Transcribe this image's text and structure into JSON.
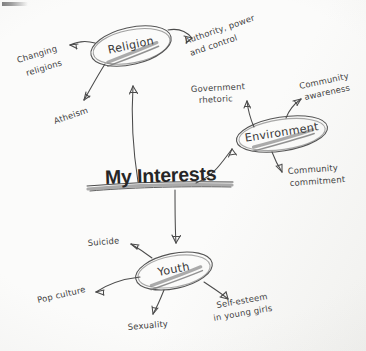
{
  "document": {
    "kind": "hand-drawn mind map",
    "medium": "scanned paper, pencil/pen",
    "title": "My Interests"
  },
  "center": {
    "label": "My Interests",
    "style": "printed bold sans-serif with hand-drawn underline"
  },
  "palette": {
    "paper": "#fbfbfa",
    "ink": "#4b4b4b",
    "ink_light": "#5a5a5a",
    "shading": "#8a8a8a",
    "title_ink": "#262626"
  },
  "nodes": [
    {
      "id": "religion",
      "label": "Religion",
      "shape": "ellipse",
      "underlined": true,
      "branches": [
        {
          "id": "changing-religions",
          "label_line1": "Changing",
          "label_line2": "religions"
        },
        {
          "id": "authority-power-control",
          "label_line1": "Authority, power",
          "label_line2": "and control"
        },
        {
          "id": "atheism",
          "label_line1": "Atheism",
          "label_line2": ""
        }
      ]
    },
    {
      "id": "environment",
      "label": "Environment",
      "shape": "ellipse",
      "underlined": true,
      "branches": [
        {
          "id": "government-rhetoric",
          "label_line1": "Government",
          "label_line2": "rhetoric"
        },
        {
          "id": "community-awareness",
          "label_line1": "Community",
          "label_line2": "awareness"
        },
        {
          "id": "community-commitment",
          "label_line1": "Community",
          "label_line2": "commitment"
        }
      ]
    },
    {
      "id": "youth",
      "label": "Youth",
      "shape": "ellipse",
      "underlined": true,
      "branches": [
        {
          "id": "suicide",
          "label_line1": "Suicide",
          "label_line2": ""
        },
        {
          "id": "pop-culture",
          "label_line1": "Pop culture",
          "label_line2": ""
        },
        {
          "id": "sexuality",
          "label_line1": "Sexuality",
          "label_line2": ""
        },
        {
          "id": "self-esteem-young-girls",
          "label_line1": "Self-esteem",
          "label_line2": "in young girls"
        }
      ]
    }
  ]
}
